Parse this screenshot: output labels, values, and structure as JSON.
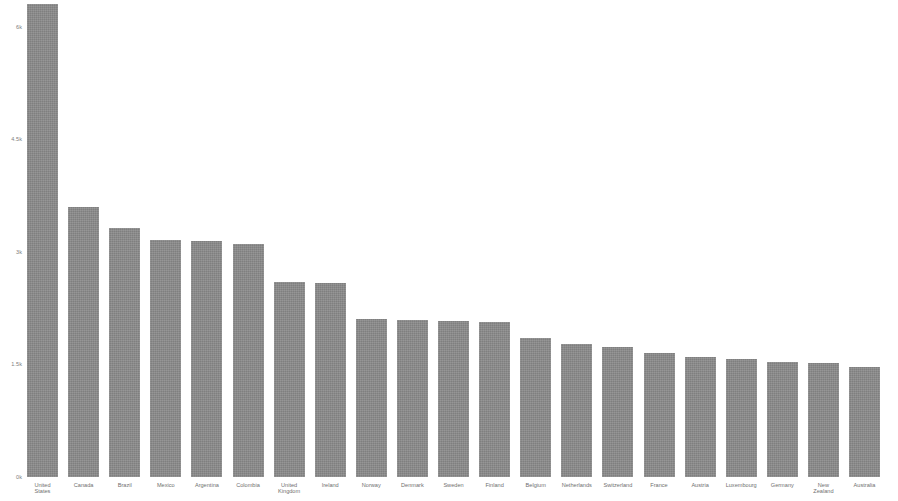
{
  "chart_data": {
    "type": "bar",
    "title": "",
    "subtitle": "",
    "xlabel": "",
    "ylabel": "",
    "grid": false,
    "legend": null,
    "orientation": "vertical",
    "bar_color": "#8a8a8a",
    "background_color": "#ffffff",
    "ylim": [
      0,
      6300
    ],
    "ytick_labels": [
      "0k",
      "1.5k",
      "3k",
      "4.5k",
      "6k"
    ],
    "ytick_values": [
      0,
      1500,
      3000,
      4500,
      6000
    ],
    "categories": [
      "United States",
      "Canada",
      "Brazil",
      "Mexico",
      "Argentina",
      "Colombia",
      "United Kingdom",
      "Ireland",
      "Norway",
      "Denmark",
      "Sweden",
      "Finland",
      "Belgium",
      "Netherlands",
      "Switzerland",
      "France",
      "Austria",
      "Luxembourg",
      "Germany",
      "New Zealand",
      "Australia"
    ],
    "values": [
      6300,
      3590,
      3320,
      3160,
      3140,
      3100,
      2600,
      2580,
      2100,
      2090,
      2080,
      2060,
      1850,
      1770,
      1730,
      1650,
      1600,
      1570,
      1530,
      1525,
      1460
    ]
  }
}
